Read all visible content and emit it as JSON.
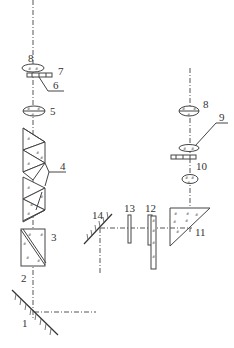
{
  "figure": {
    "type": "optical-system-schematic",
    "background": "#ffffff",
    "ink_color": "#444444"
  },
  "labels": {
    "c1": "1",
    "c2": "2",
    "c3": "3",
    "c4": "4",
    "c5": "5",
    "c6": "6",
    "c7": "7",
    "c8a": "8",
    "c8b": "8",
    "c9": "9",
    "c10": "10",
    "c11": "11",
    "c12": "12",
    "c13": "13",
    "c14": "14"
  },
  "components": [
    {
      "id": "1",
      "kind": "plane-mirror"
    },
    {
      "id": "2",
      "kind": "beam-splitter-prism"
    },
    {
      "id": "3",
      "kind": "prism-block"
    },
    {
      "id": "4",
      "kind": "prism-pair"
    },
    {
      "id": "5",
      "kind": "lens"
    },
    {
      "id": "6",
      "kind": "plate"
    },
    {
      "id": "7",
      "kind": "lens"
    },
    {
      "id": "8",
      "kind": "lens"
    },
    {
      "id": "9",
      "kind": "lens"
    },
    {
      "id": "10",
      "kind": "plate"
    },
    {
      "id": "11",
      "kind": "right-angle-prism"
    },
    {
      "id": "12",
      "kind": "wedge-plate"
    },
    {
      "id": "13",
      "kind": "plate"
    },
    {
      "id": "14",
      "kind": "plane-mirror"
    }
  ]
}
